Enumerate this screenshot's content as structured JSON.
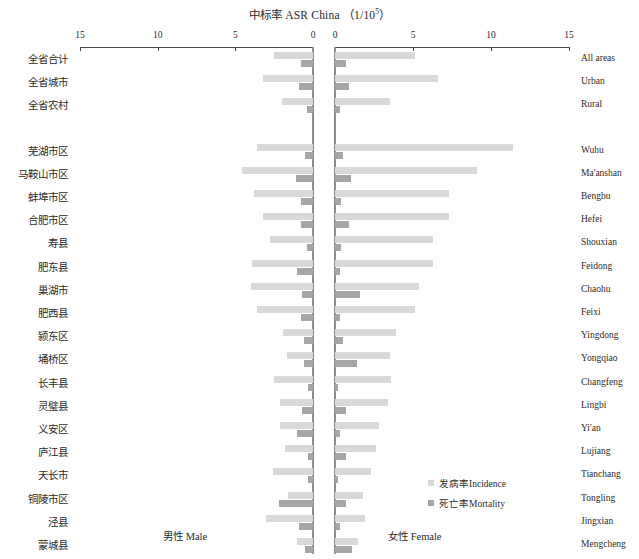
{
  "title": {
    "cn": "中标率",
    "en": "ASR China",
    "unit_prefix": "（1/10",
    "unit_sup": "5",
    "unit_suffix": "）",
    "full": "中标率 ASR China（1/10⁵）"
  },
  "axis": {
    "left_ticks": [
      "15",
      "10",
      "5",
      "0"
    ],
    "right_ticks": [
      "0",
      "5",
      "10",
      "15"
    ],
    "max": 15,
    "min": 0
  },
  "legend": {
    "position": "bottom-center-right",
    "items": [
      {
        "label_cn": "发病率",
        "label_en": "Incidence",
        "color": "#d9d9d9"
      },
      {
        "label_cn": "死亡率",
        "label_en": "Mortality",
        "color": "#a6a6a6"
      }
    ]
  },
  "sex_labels": {
    "left_cn": "男性",
    "left_en": "Male",
    "right_cn": "女性",
    "right_en": "Female"
  },
  "chart_data": {
    "type": "bar",
    "orientation": "horizontal-diverging",
    "xlabel": "中标率 ASR China (1/10^5)",
    "ylabel": "",
    "xlim": [
      0,
      15
    ],
    "grid": false,
    "legend_position": "bottom-center",
    "left_panel": "男性 Male",
    "right_panel": "女性 Female",
    "series": [
      {
        "name": "发病率Incidence",
        "color": "#d9d9d9"
      },
      {
        "name": "死亡率Mortality",
        "color": "#a6a6a6"
      }
    ],
    "categories": [
      "全省合计",
      "全省城市",
      "全省农村",
      "芜湖市区",
      "马鞍山市区",
      "蚌埠市区",
      "合肥市区",
      "寿县",
      "肥东县",
      "巢湖市",
      "肥西县",
      "颍东区",
      "埇桥区",
      "长丰县",
      "灵璧县",
      "义安区",
      "庐江县",
      "天长市",
      "铜陵市区",
      "泾县",
      "蒙城县"
    ],
    "categories_en": [
      "All areas",
      "Urban",
      "Rural",
      "Wuhu",
      "Ma'anshan",
      "Bengbu",
      "Hefei",
      "Shouxian",
      "Feidong",
      "Chaohu",
      "Feixi",
      "Yingdong",
      "Yongqiao",
      "Changfeng",
      "Lingbi",
      "Yi'an",
      "Lujiang",
      "Tianchang",
      "Tongling",
      "Jingxian",
      "Mengcheng"
    ],
    "rows": [
      {
        "cn": "全省合计",
        "en": "All areas",
        "group": "province",
        "male_incidence": 2.5,
        "male_mortality": 0.8,
        "female_incidence": 5.1,
        "female_mortality": 0.7
      },
      {
        "cn": "全省城市",
        "en": "Urban",
        "group": "province",
        "male_incidence": 3.2,
        "male_mortality": 0.9,
        "female_incidence": 6.6,
        "female_mortality": 0.9
      },
      {
        "cn": "全省农村",
        "en": "Rural",
        "group": "province",
        "male_incidence": 2.0,
        "male_mortality": 0.4,
        "female_incidence": 3.5,
        "female_mortality": 0.3
      },
      {
        "cn": "芜湖市区",
        "en": "Wuhu",
        "group": "city",
        "male_incidence": 3.6,
        "male_mortality": 0.5,
        "female_incidence": 11.4,
        "female_mortality": 0.5
      },
      {
        "cn": "马鞍山市区",
        "en": "Ma'anshan",
        "group": "city",
        "male_incidence": 4.6,
        "male_mortality": 1.1,
        "female_incidence": 9.1,
        "female_mortality": 1.0
      },
      {
        "cn": "蚌埠市区",
        "en": "Bengbu",
        "group": "city",
        "male_incidence": 3.8,
        "male_mortality": 0.8,
        "female_incidence": 7.3,
        "female_mortality": 0.4
      },
      {
        "cn": "合肥市区",
        "en": "Hefei",
        "group": "city",
        "male_incidence": 3.2,
        "male_mortality": 0.8,
        "female_incidence": 7.3,
        "female_mortality": 0.9
      },
      {
        "cn": "寿县",
        "en": "Shouxian",
        "group": "city",
        "male_incidence": 2.8,
        "male_mortality": 0.4,
        "female_incidence": 6.3,
        "female_mortality": 0.4
      },
      {
        "cn": "肥东县",
        "en": "Feidong",
        "group": "city",
        "male_incidence": 3.9,
        "male_mortality": 1.0,
        "female_incidence": 6.3,
        "female_mortality": 0.3
      },
      {
        "cn": "巢湖市",
        "en": "Chaohu",
        "group": "city",
        "male_incidence": 4.0,
        "male_mortality": 0.7,
        "female_incidence": 5.4,
        "female_mortality": 1.6
      },
      {
        "cn": "肥西县",
        "en": "Feixi",
        "group": "city",
        "male_incidence": 3.6,
        "male_mortality": 0.8,
        "female_incidence": 5.1,
        "female_mortality": 0.3
      },
      {
        "cn": "颍东区",
        "en": "Yingdong",
        "group": "city",
        "male_incidence": 1.9,
        "male_mortality": 0.6,
        "female_incidence": 3.9,
        "female_mortality": 0.5
      },
      {
        "cn": "埇桥区",
        "en": "Yongqiao",
        "group": "city",
        "male_incidence": 1.7,
        "male_mortality": 0.6,
        "female_incidence": 3.5,
        "female_mortality": 1.4
      },
      {
        "cn": "长丰县",
        "en": "Changfeng",
        "group": "city",
        "male_incidence": 2.5,
        "male_mortality": 0.3,
        "female_incidence": 3.6,
        "female_mortality": 0.2
      },
      {
        "cn": "灵璧县",
        "en": "Lingbi",
        "group": "city",
        "male_incidence": 2.1,
        "male_mortality": 0.7,
        "female_incidence": 3.4,
        "female_mortality": 0.7
      },
      {
        "cn": "义安区",
        "en": "Yi'an",
        "group": "city",
        "male_incidence": 2.1,
        "male_mortality": 1.0,
        "female_incidence": 2.8,
        "female_mortality": 0.3
      },
      {
        "cn": "庐江县",
        "en": "Lujiang",
        "group": "city",
        "male_incidence": 1.8,
        "male_mortality": 0.3,
        "female_incidence": 2.6,
        "female_mortality": 0.7
      },
      {
        "cn": "天长市",
        "en": "Tianchang",
        "group": "city",
        "male_incidence": 2.6,
        "male_mortality": 0.3,
        "female_incidence": 2.3,
        "female_mortality": 0.2
      },
      {
        "cn": "铜陵市区",
        "en": "Tongling",
        "group": "city",
        "male_incidence": 1.6,
        "male_mortality": 2.2,
        "female_incidence": 1.8,
        "female_mortality": 0.7
      },
      {
        "cn": "泾县",
        "en": "Jingxian",
        "group": "city",
        "male_incidence": 3.0,
        "male_mortality": 0.9,
        "female_incidence": 1.9,
        "female_mortality": 0.3
      },
      {
        "cn": "蒙城县",
        "en": "Mengcheng",
        "group": "city",
        "male_incidence": 1.0,
        "male_mortality": 0.5,
        "female_incidence": 1.5,
        "female_mortality": 1.1
      }
    ]
  },
  "layout": {
    "left_axis_x0": 80,
    "left_axis_x1": 313,
    "right_axis_x0": 335,
    "right_axis_x1": 569,
    "axis_y": 30,
    "group_gap": 22,
    "row_start_y": 52,
    "row_step": 23.2
  }
}
